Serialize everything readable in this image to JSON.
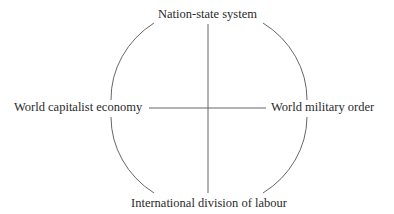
{
  "diagram": {
    "nodes": {
      "top": "Nation-state system",
      "left": "World capitalist economy",
      "right": "World military order",
      "bottom": "International division of labour"
    },
    "edges": [
      {
        "from": "top",
        "to": "bottom",
        "type": "axis-vertical"
      },
      {
        "from": "left",
        "to": "right",
        "type": "axis-horizontal"
      },
      {
        "from": "top",
        "to": "left",
        "type": "arc"
      },
      {
        "from": "top",
        "to": "right",
        "type": "arc"
      },
      {
        "from": "bottom",
        "to": "left",
        "type": "arc"
      },
      {
        "from": "bottom",
        "to": "right",
        "type": "arc"
      }
    ],
    "colors": {
      "line": "#555555",
      "text": "#2a2a2a"
    }
  }
}
